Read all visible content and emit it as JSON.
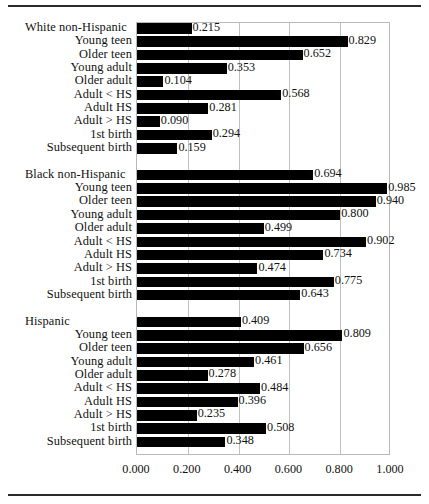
{
  "chart_data": {
    "type": "bar",
    "orientation": "horizontal",
    "title": "",
    "subtitle": "",
    "xlabel": "",
    "ylabel": "",
    "xlim": [
      0.0,
      1.0
    ],
    "xticks": [
      "0.000",
      "0.200",
      "0.400",
      "0.600",
      "0.800",
      "1.000"
    ],
    "xtick_values": [
      0.0,
      0.2,
      0.4,
      0.6,
      0.8,
      1.0
    ],
    "grid": true,
    "legend": "none",
    "bar_color": "#000000",
    "value_label_format": "0.000",
    "groups": [
      {
        "name": "White non-Hispanic",
        "categories": [
          "White non-Hispanic",
          "Young teen",
          "Older teen",
          "Young adult",
          "Older adult",
          "Adult < HS",
          "Adult HS",
          "Adult > HS",
          "1st birth",
          "Subsequent birth"
        ],
        "values": [
          0.215,
          0.829,
          0.652,
          0.353,
          0.104,
          0.568,
          0.281,
          0.09,
          0.294,
          0.159
        ],
        "labels": [
          "0.215",
          "0.829",
          "0.652",
          "0.353",
          "0.104",
          "0.568",
          "0.281",
          "0.090",
          "0.294",
          "0.159"
        ]
      },
      {
        "name": "Black non-Hispanic",
        "categories": [
          "Black non-Hispanic",
          "Young teen",
          "Older teen",
          "Young adult",
          "Older adult",
          "Adult < HS",
          "Adult HS",
          "Adult > HS",
          "1st birth",
          "Subsequent birth"
        ],
        "values": [
          0.694,
          0.985,
          0.94,
          0.8,
          0.499,
          0.902,
          0.734,
          0.474,
          0.775,
          0.643
        ],
        "labels": [
          "0.694",
          "0.985",
          "0.940",
          "0.800",
          "0.499",
          "0.902",
          "0.734",
          "0.474",
          "0.775",
          "0.643"
        ]
      },
      {
        "name": "Hispanic",
        "categories": [
          "Hispanic",
          "Young teen",
          "Older teen",
          "Young adult",
          "Older adult",
          "Adult < HS",
          "Adult HS",
          "Adult > HS",
          "1st birth",
          "Subsequent birth"
        ],
        "values": [
          0.409,
          0.809,
          0.656,
          0.461,
          0.278,
          0.484,
          0.396,
          0.235,
          0.508,
          0.348
        ],
        "labels": [
          "0.409",
          "0.809",
          "0.656",
          "0.461",
          "0.278",
          "0.484",
          "0.396",
          "0.235",
          "0.508",
          "0.348"
        ]
      }
    ]
  }
}
